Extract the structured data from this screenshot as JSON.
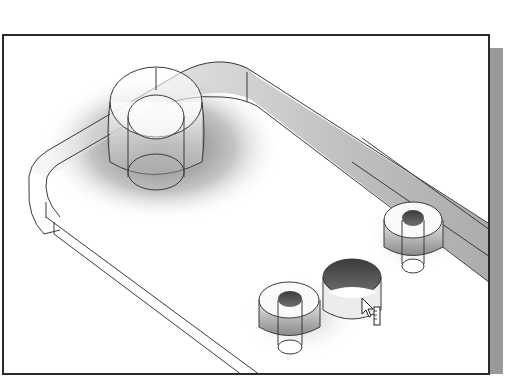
{
  "viewport": {
    "label": "3D model viewport",
    "view": "isometric shaded with edges",
    "colors": {
      "frame": "#2a2a2a",
      "shadow": "#9a9a9a",
      "edge": "#3a3a3a",
      "background": "#ffffff",
      "hole_dark": "#555555"
    }
  },
  "model": {
    "base_plate": {
      "name": "rounded base plate"
    },
    "features": [
      {
        "name": "large boss",
        "type": "cylinder-with-hole"
      },
      {
        "name": "small boss right",
        "type": "counterbored-hole"
      },
      {
        "name": "small boss front",
        "type": "counterbored-hole"
      },
      {
        "name": "highlighted cylinder",
        "type": "cylinder",
        "state": "pre-selected"
      }
    ]
  },
  "cursor": {
    "icon": "pointer-with-ruler",
    "state": "hover"
  }
}
